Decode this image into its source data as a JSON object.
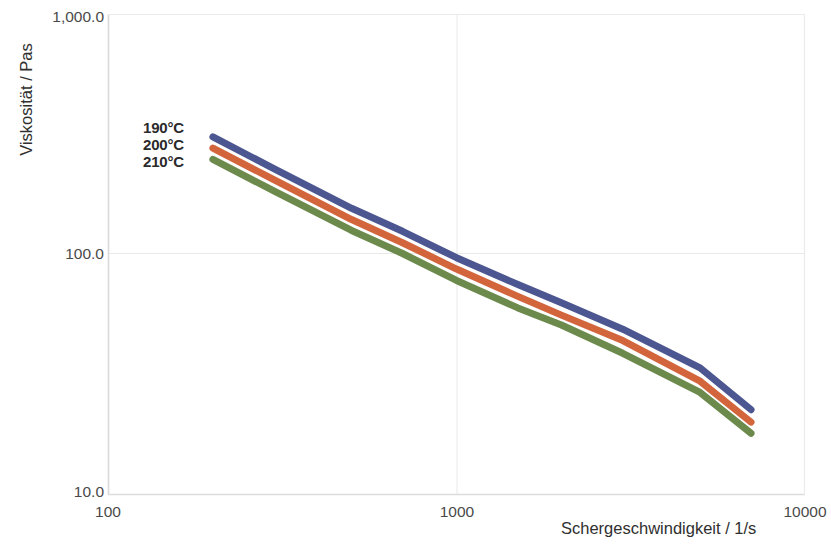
{
  "chart_data": {
    "type": "line",
    "title": "",
    "xlabel": "Schergeschwindigkeit / 1/s",
    "ylabel": "Viskosität / Pas",
    "xscale": "log",
    "yscale": "log",
    "xlim": [
      100,
      10000
    ],
    "ylim": [
      10,
      1000
    ],
    "xticks": [
      "100",
      "1000",
      "10000"
    ],
    "xtick_values": [
      100,
      1000,
      10000
    ],
    "yticks": [
      "10.0",
      "100.0",
      "1,000.0"
    ],
    "ytick_values": [
      10,
      100,
      1000
    ],
    "grid": true,
    "legend_position": "inside-upper-left",
    "series": [
      {
        "name": "190°C",
        "color": "#4c5690",
        "x": [
          200,
          300,
          500,
          700,
          1000,
          1500,
          2000,
          3000,
          5000,
          7000
        ],
        "y": [
          310,
          227,
          155,
          124,
          96,
          74,
          62,
          48,
          33,
          22
        ]
      },
      {
        "name": "200°C",
        "color": "#d2653c",
        "x": [
          200,
          300,
          500,
          700,
          1000,
          1500,
          2000,
          3000,
          5000,
          7000
        ],
        "y": [
          278,
          204,
          139,
          111,
          86,
          66,
          55,
          43,
          29,
          19.5
        ]
      },
      {
        "name": "210°C",
        "color": "#6b8a4b",
        "x": [
          200,
          300,
          500,
          700,
          1000,
          1500,
          2000,
          3000,
          5000,
          7000
        ],
        "y": [
          249,
          183,
          125,
          100,
          77,
          59,
          50,
          38,
          26,
          17.5
        ]
      }
    ]
  },
  "legend": {
    "items": [
      {
        "label": "190°C"
      },
      {
        "label": "200°C"
      },
      {
        "label": "210°C"
      }
    ]
  },
  "axes": {
    "y_title": "Viskosität / Pas",
    "x_title": "Schergeschwindigkeit / 1/s",
    "y_tick_labels": [
      "1,000.0",
      "100.0",
      "10.0"
    ],
    "x_tick_labels": [
      "100",
      "1000",
      "10000"
    ]
  },
  "style": {
    "axis_color": "#d8d8d8",
    "grid_color": "#e9e9e9",
    "text_color": "#3a3a3a",
    "background": "#ffffff",
    "line_width_px": 7
  }
}
